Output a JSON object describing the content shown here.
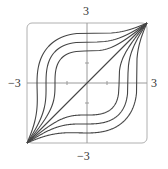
{
  "chart_data": {
    "type": "line",
    "title": "",
    "xlabel": "",
    "ylabel": "",
    "xlim": [
      -3,
      3
    ],
    "ylim": [
      -3,
      3
    ],
    "grid": false,
    "frame": "rounded-box",
    "tick_labels": {
      "top": "3",
      "bottom": "−3",
      "left": "−3",
      "right": "3"
    },
    "minor_ticks": [
      -1,
      1
    ],
    "family_description": "Level curves through corners (-3,-3) and (3,3); horizontal tangent at x=0, vertical tangent at y=0",
    "model": "y^3 - x^3 = C*(1 - x^2*y^2/81)",
    "series": [
      {
        "name": "diagonal",
        "C": 0,
        "y_at_x0": 0
      },
      {
        "name": "upper-1",
        "C": 4.1,
        "y_at_x0": 1.6,
        "x_at_y0": -1.6
      },
      {
        "name": "upper-2",
        "C": 8.6,
        "y_at_x0": 2.05,
        "x_at_y0": -2.05
      },
      {
        "name": "upper-3",
        "C": 15.6,
        "y_at_x0": 2.5,
        "x_at_y0": -2.5
      },
      {
        "name": "lower-1",
        "C": -4.1,
        "y_at_x0": -1.6,
        "x_at_y0": 1.6
      },
      {
        "name": "lower-2",
        "C": -8.6,
        "y_at_x0": -2.05,
        "x_at_y0": 2.05
      },
      {
        "name": "lower-3",
        "C": -15.6,
        "y_at_x0": -2.5,
        "x_at_y0": 2.5
      }
    ]
  },
  "colors": {
    "curve": "#454545",
    "axis": "#9a9a9a",
    "frame": "#b0b0b0",
    "label": "#333333"
  }
}
